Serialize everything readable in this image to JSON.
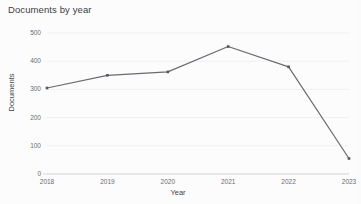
{
  "chart_data": {
    "type": "line",
    "title": "Documents by year",
    "xlabel": "Year",
    "ylabel": "Documents",
    "categories": [
      "2018",
      "2019",
      "2020",
      "2021",
      "2022",
      "2023"
    ],
    "values": [
      305,
      350,
      362,
      452,
      380,
      55
    ],
    "series": [
      {
        "name": "Documents",
        "values": [
          305,
          350,
          362,
          452,
          380,
          55
        ]
      }
    ],
    "ylim": [
      0,
      500
    ],
    "yticks": [
      "0",
      "100",
      "200",
      "300",
      "400",
      "500"
    ],
    "ytick_values": [
      0,
      100,
      200,
      300,
      400,
      500
    ],
    "xticks": [
      "2018",
      "2019",
      "2020",
      "2021",
      "2022",
      "2023"
    ],
    "grid": true,
    "legend": "none",
    "line_color": "#6a6a70",
    "marker_color": "#55555b",
    "grid_color": "#f0f0f2",
    "axis_color": "#d8d8dc",
    "background_color": "#fcfcfc",
    "text_color": "#44444a",
    "title_color": "#3d3d42"
  }
}
